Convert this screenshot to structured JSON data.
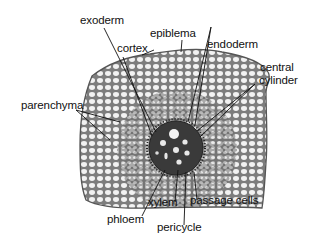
{
  "diagram": {
    "colors": {
      "background": "#ffffff",
      "tissue_fill": "#8a8a8a",
      "cell_lumen": "#f2f2f2",
      "stele_fill": "#3a3a3a",
      "leader_line": "#111111",
      "label_text": "#111111"
    },
    "labels": {
      "exoderm": "exoderm",
      "epiblema": "epiblema",
      "cortex": "cortex",
      "endoderm": "endoderm",
      "central_cylinder": "central",
      "central_cylinder_2": "cylinder",
      "parenchyma": "parenchyma",
      "xylem": "xylem",
      "passage_cells": "passage cells",
      "phloem": "phloem",
      "pericycle": "pericycle"
    }
  }
}
